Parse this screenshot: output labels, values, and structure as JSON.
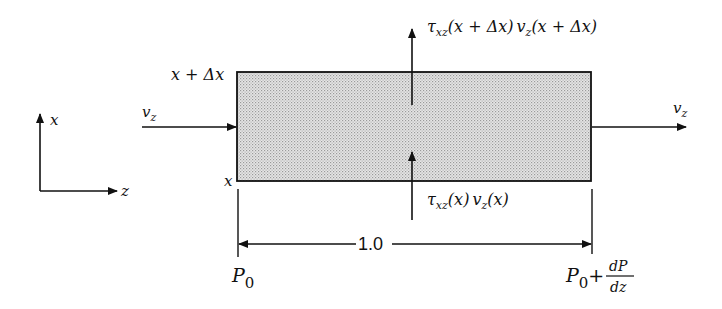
{
  "diagram": {
    "colors": {
      "line": "#111111",
      "fill": "#d4d4d4"
    },
    "axes": {
      "x_label": "x",
      "z_label": "z"
    },
    "element": {
      "top_label": "x + Δx",
      "bottom_label": "x"
    },
    "flows": {
      "inlet_label": "v",
      "inlet_sub": "z",
      "outlet_label": "v",
      "outlet_sub": "z"
    },
    "fluxes": {
      "top": {
        "tau": "τ",
        "tau_sub": "xz",
        "arg1": "(x + Δx)",
        "v": "v",
        "v_sub": "z",
        "arg2": "(x + Δx)"
      },
      "bottom": {
        "tau": "τ",
        "tau_sub": "xz",
        "arg1": "(x)",
        "v": "v",
        "v_sub": "z",
        "arg2": "(x)"
      }
    },
    "dimension": {
      "length_label": "1.0"
    },
    "pressures": {
      "left": {
        "P": "P",
        "sub": "0"
      },
      "right": {
        "P": "P",
        "sub": "0",
        "plus": "+",
        "num": "dP",
        "den": "dz"
      }
    }
  }
}
